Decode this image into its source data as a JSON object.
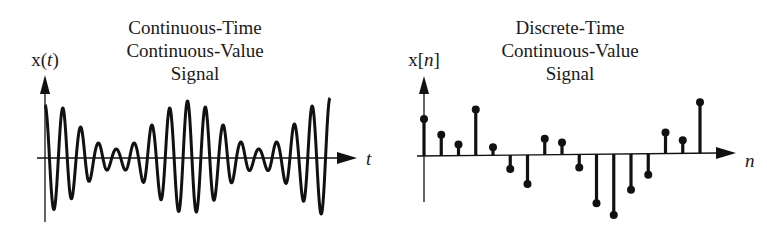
{
  "panels": [
    {
      "id": "continuous",
      "title_lines": [
        "Continuous-Time",
        "Continuous-Value",
        "Signal"
      ],
      "y_label_prefix": "x(",
      "y_label_var": "t",
      "y_label_suffix": ")",
      "x_label": "t"
    },
    {
      "id": "discrete",
      "title_lines": [
        "Discrete-Time",
        "Continuous-Value",
        "Signal"
      ],
      "y_label_prefix": "x[",
      "y_label_var": "n",
      "y_label_suffix": "]",
      "x_label": "n"
    }
  ],
  "chart_data": [
    {
      "type": "line",
      "title": "Continuous-Time Continuous-Value Signal",
      "xlabel": "t",
      "ylabel": "x(t)",
      "description": "Amplitude-modulated oscillation; envelope amplitude at each successive half-cycle peak",
      "cycles": 8.5,
      "peak_envelope": [
        5.3,
        5.0,
        3.1,
        1.5,
        0.9,
        1.5,
        3.3,
        5.0,
        5.7,
        5.1,
        3.3,
        1.6,
        0.9,
        1.6,
        3.4,
        5.2,
        6.0
      ],
      "grid": false
    },
    {
      "type": "stem",
      "title": "Discrete-Time Continuous-Value Signal",
      "xlabel": "n",
      "ylabel": "x[n]",
      "x": [
        0,
        1,
        2,
        3,
        4,
        5,
        6,
        7,
        8,
        9,
        10,
        11,
        12,
        13,
        14,
        15,
        16
      ],
      "values": [
        3.7,
        2.1,
        1.1,
        4.6,
        0.8,
        -1.4,
        -2.9,
        1.6,
        1.2,
        -1.3,
        -4.9,
        -6.1,
        -3.6,
        -2.1,
        2.1,
        1.3,
        5.1
      ],
      "grid": false
    }
  ],
  "colors": {
    "ink": "#111111",
    "background": "#ffffff"
  }
}
